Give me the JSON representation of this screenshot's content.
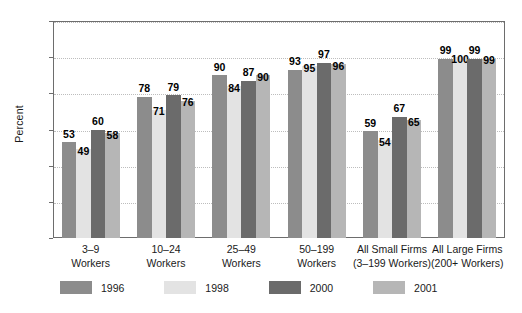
{
  "chart_data": {
    "type": "bar",
    "title": "",
    "xlabel": "",
    "ylabel": "Percent",
    "ylim": [
      0,
      120
    ],
    "yticks": [
      0,
      20,
      40,
      60,
      80,
      100,
      120
    ],
    "grid": true,
    "legend_position": "bottom",
    "categories": [
      "3–9\nWorkers",
      "10–24\nWorkers",
      "25–49\nWorkers",
      "50–199\nWorkers",
      "All Small Firms\n(3–199 Workers)",
      "All Large Firms\n(200+ Workers)"
    ],
    "category_lines": [
      [
        "3–9",
        "Workers"
      ],
      [
        "10–24",
        "Workers"
      ],
      [
        "25–49",
        "Workers"
      ],
      [
        "50–199",
        "Workers"
      ],
      [
        "All Small Firms",
        "(3–199 Workers)"
      ],
      [
        "All Large Firms",
        "(200+ Workers)"
      ]
    ],
    "series": [
      {
        "name": "1996",
        "color": "#8c8c8c",
        "values": [
          53,
          78,
          90,
          93,
          59,
          99
        ]
      },
      {
        "name": "1998",
        "color": "#e3e3e3",
        "values": [
          49,
          71,
          84,
          95,
          54,
          100
        ]
      },
      {
        "name": "2000",
        "color": "#6b6b6b",
        "values": [
          60,
          79,
          87,
          97,
          67,
          99
        ]
      },
      {
        "name": "2001",
        "color": "#b6b6b6",
        "values": [
          58,
          76,
          90,
          96,
          65,
          99
        ]
      }
    ]
  },
  "legend": {
    "items": [
      {
        "label": "1996",
        "color": "#8c8c8c"
      },
      {
        "label": "1998",
        "color": "#e3e3e3"
      },
      {
        "label": "2000",
        "color": "#6b6b6b"
      },
      {
        "label": "2001",
        "color": "#b6b6b6"
      }
    ]
  },
  "axis": {
    "y_title": "Percent"
  }
}
